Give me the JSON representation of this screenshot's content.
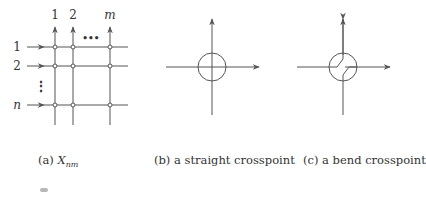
{
  "figure": {
    "panel_a": {
      "caption_label": "(a)",
      "caption_var": "X",
      "caption_sub": "nm",
      "column_labels": [
        "1",
        "2",
        "m"
      ],
      "row_labels": [
        "1",
        "2",
        "n"
      ],
      "column_ellipsis": "•••",
      "row_ellipsis": "⋮"
    },
    "panel_b": {
      "caption": "(b) a straight crosspoint"
    },
    "panel_c": {
      "caption": "(c) a bend crosspoint"
    }
  },
  "colors": {
    "line": "#555555",
    "text": "#333333",
    "background": "#ffffff"
  }
}
